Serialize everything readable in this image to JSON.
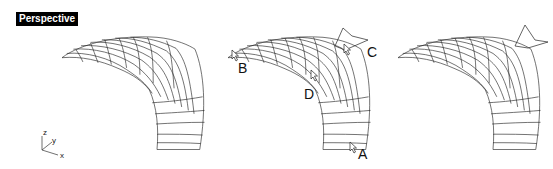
{
  "viewport": {
    "label": "Perspective"
  },
  "axes": {
    "x": "x",
    "y": "y",
    "z": "z"
  },
  "points": [
    {
      "id": "A",
      "label": "A"
    },
    {
      "id": "B",
      "label": "B"
    },
    {
      "id": "C",
      "label": "C"
    },
    {
      "id": "D",
      "label": "D"
    }
  ],
  "panels": [
    "original-surface",
    "picked-points-surface",
    "result-surface"
  ]
}
